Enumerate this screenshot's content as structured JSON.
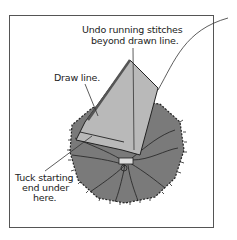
{
  "labels": {
    "undo": [
      "Undo running stitches",
      "beyond drawn line."
    ],
    "draw": "Draw line.",
    "tuck": [
      "Tuck starting",
      "end under",
      "here."
    ]
  },
  "colors": {
    "fabric_dark": "#7a7a7a",
    "fabric_light": "#b9b9b9",
    "outline": "#222222",
    "frame": "#555555"
  }
}
